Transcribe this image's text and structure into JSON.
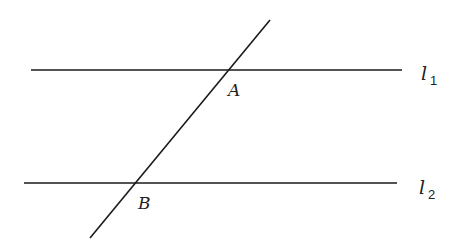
{
  "diagram": {
    "lines": [
      {
        "id": "l1",
        "label": "l",
        "subscript": "1"
      },
      {
        "id": "l2",
        "label": "l",
        "subscript": "2"
      }
    ],
    "transversal": {
      "id": "AB"
    },
    "points": [
      {
        "id": "A",
        "label": "A"
      },
      {
        "id": "B",
        "label": "B"
      }
    ],
    "colors": {
      "stroke": "#1a1a1a",
      "text": "#222222"
    }
  }
}
